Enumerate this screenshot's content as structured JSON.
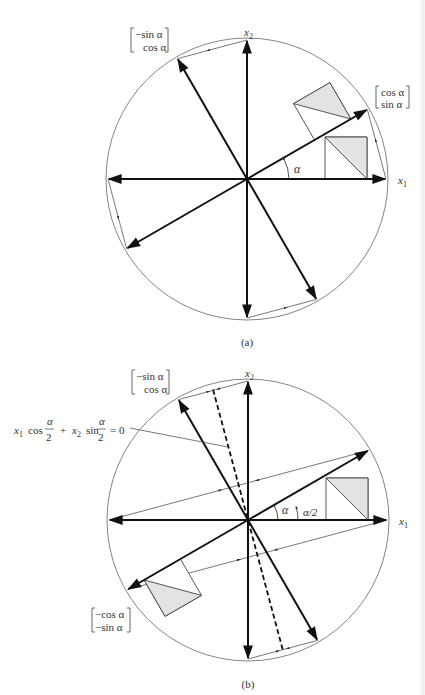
{
  "figure_a": {
    "caption": "(a)",
    "center": [
      247,
      179
    ],
    "radius": 141,
    "alpha_deg": 30,
    "axis_labels": {
      "x1": "x",
      "x1_sub": "1",
      "x2": "x",
      "x2_sub": "2"
    },
    "angle_label": "α",
    "vector_labels": {
      "u": {
        "top": "cos α",
        "bottom": "sin α"
      },
      "v": {
        "top": "−sin α",
        "bottom": "cos α"
      }
    }
  },
  "figure_b": {
    "caption": "(b)",
    "center": [
      248,
      520
    ],
    "radius": 141,
    "alpha_deg": 30,
    "axis_labels": {
      "x1": "x",
      "x1_sub": "1",
      "x2": "x",
      "x2_sub": "2"
    },
    "angle_label": "α",
    "half_angle_label": "α/2",
    "line_equation": {
      "x1": "x",
      "x1_sub": "1",
      "cos": "cos",
      "frac1_num": "α",
      "frac1_den": "2",
      "plus": "+",
      "x2": "x",
      "x2_sub": "2",
      "sin": "sin",
      "frac2_num": "α",
      "frac2_den": "2",
      "eq": "= 0"
    },
    "vector_labels": {
      "v": {
        "top": "−sin α",
        "bottom": "cos α"
      },
      "w": {
        "top": "−cos α",
        "bottom": "−sin α"
      }
    }
  },
  "colors": {
    "stroke": "#111111",
    "thin": "#555555",
    "shade": "#e3e3e3",
    "circle": "#777777"
  }
}
